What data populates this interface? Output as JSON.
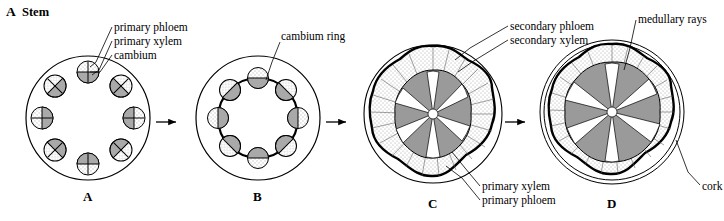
{
  "figure": {
    "title_letter": "A",
    "title_word": "Stem"
  },
  "panels": [
    {
      "letter": "A"
    },
    {
      "letter": "B"
    },
    {
      "letter": "C"
    },
    {
      "letter": "D"
    }
  ],
  "labels": {
    "primary_phloem_top": "primary phloem",
    "primary_xylem_top": "primary xylem",
    "cambium": "cambium",
    "cambium_ring": "cambium ring",
    "secondary_phloem": "secondary phloem",
    "secondary_xylem": "secondary xylem",
    "medullary_rays": "medullary rays",
    "primary_xylem_bottom": "primary xylem",
    "primary_phloem_bottom": "primary phloem",
    "cork": "cork"
  },
  "arrows": [
    {
      "name": "arrow-a-to-b"
    },
    {
      "name": "arrow-b-to-c"
    },
    {
      "name": "arrow-c-to-d"
    }
  ],
  "colors": {
    "stroke": "#000000",
    "background": "#ffffff",
    "xylem_fill": "#9a9a9a",
    "stipple_fill": "#d8d8d8",
    "cambium_ring": "#000000"
  },
  "diagram_description": {
    "subject": "Secondary growth in a dicot stem",
    "stages": [
      "A: young stem cross-section with ring of discrete vascular bundles, each showing primary phloem, primary xylem and cambium",
      "B: cambium ring forms connecting the vascular bundles",
      "C: secondary xylem and secondary phloem produced, bundles expand inward and outward",
      "D: older stem with extensive secondary xylem, medullary rays and cork on the outside"
    ]
  }
}
